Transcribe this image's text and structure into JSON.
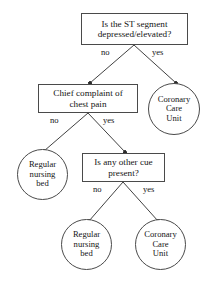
{
  "diagram": {
    "type": "decision-tree",
    "colors": {
      "background": "#ffffff",
      "stroke": "#4a4a4a",
      "text": "#151515",
      "edge": "#2b2b2b"
    },
    "nodes": [
      {
        "id": "st-segment",
        "shape": "rect",
        "text": "Is the ST segment\ndepressed/elevated?",
        "x": 81,
        "y": 13,
        "w": 107,
        "h": 32
      },
      {
        "id": "chief-complaint",
        "shape": "rect",
        "text": "Chief complaint of\nchest pain",
        "x": 38,
        "y": 84,
        "w": 100,
        "h": 29
      },
      {
        "id": "coronary-care-unit-top",
        "shape": "circle",
        "text": "Coronary\nCare\nUnit",
        "x": 148,
        "y": 83,
        "w": 52,
        "h": 52
      },
      {
        "id": "regular-nursing-bed-mid",
        "shape": "circle",
        "text": "Regular\nnursing\nbed",
        "x": 17,
        "y": 149,
        "w": 51,
        "h": 51
      },
      {
        "id": "other-cue",
        "shape": "rect",
        "text": "Is any other cue\npresent?",
        "x": 82,
        "y": 153,
        "w": 83,
        "h": 29
      },
      {
        "id": "regular-nursing-bed-bottom",
        "shape": "circle",
        "text": "Regular\nnursing\nbed",
        "x": 61,
        "y": 219,
        "w": 51,
        "h": 51
      },
      {
        "id": "coronary-care-unit-bottom",
        "shape": "circle",
        "text": "Coronary\nCare\nUnit",
        "x": 135,
        "y": 219,
        "w": 51,
        "h": 51
      }
    ],
    "edges": [
      {
        "id": "e1",
        "from": "st-segment",
        "to": "chief-complaint",
        "label": "no",
        "x1": 134,
        "y1": 45,
        "x2": 90,
        "y2": 83,
        "lx": 101,
        "ly": 47
      },
      {
        "id": "e2",
        "from": "st-segment",
        "to": "coronary-care-unit-top",
        "label": "yes",
        "x1": 134,
        "y1": 45,
        "x2": 176,
        "y2": 83,
        "lx": 152,
        "ly": 47
      },
      {
        "id": "e3",
        "from": "chief-complaint",
        "to": "regular-nursing-bed-mid",
        "label": "no",
        "x1": 88,
        "y1": 113,
        "x2": 44,
        "y2": 151,
        "lx": 50,
        "ly": 115
      },
      {
        "id": "e4",
        "from": "chief-complaint",
        "to": "other-cue",
        "label": "yes",
        "x1": 88,
        "y1": 113,
        "x2": 125,
        "y2": 152,
        "lx": 103,
        "ly": 115
      },
      {
        "id": "e5",
        "from": "other-cue",
        "to": "regular-nursing-bed-bottom",
        "label": "no",
        "x1": 123,
        "y1": 182,
        "x2": 89,
        "y2": 221,
        "lx": 93,
        "ly": 184
      },
      {
        "id": "e6",
        "from": "other-cue",
        "to": "coronary-care-unit-bottom",
        "label": "yes",
        "x1": 123,
        "y1": 182,
        "x2": 158,
        "y2": 221,
        "lx": 143,
        "ly": 184
      }
    ]
  }
}
